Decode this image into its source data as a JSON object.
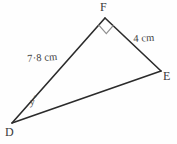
{
  "figure": {
    "background_color": "#fefefe",
    "stroke_color": "#2b2b2b",
    "text_color": "#3a3a3a",
    "right_angle_marker_color": "#8a8a8a"
  },
  "vertices": [
    {
      "name": "F",
      "label": "F",
      "x": 105,
      "y": 18
    },
    {
      "name": "E",
      "label": "E",
      "x": 161,
      "y": 71
    },
    {
      "name": "D",
      "label": "D",
      "x": 12,
      "y": 123
    }
  ],
  "sides": [
    {
      "name": "DF",
      "label": "7·8 cm",
      "value": "7.8",
      "unit": "cm",
      "from": "D",
      "to": "F"
    },
    {
      "name": "FE",
      "label": "4 cm",
      "value": "4",
      "unit": "cm",
      "from": "F",
      "to": "E"
    },
    {
      "name": "DE",
      "label": "",
      "from": "D",
      "to": "E"
    }
  ],
  "angles": [
    {
      "at": "F",
      "label": "",
      "marker": "right-angle",
      "measure": "90"
    },
    {
      "at": "D",
      "label": "y",
      "degree_symbol": "°",
      "measure": "y"
    }
  ]
}
